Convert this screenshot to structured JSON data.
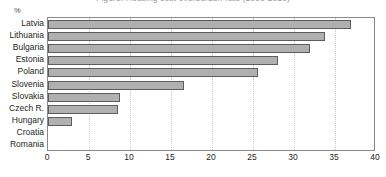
{
  "header": {
    "cropped_title": "Figure: Housing cost overburden rate (2008-2010)",
    "unit_label": "%"
  },
  "chart_data": {
    "type": "bar",
    "orientation": "horizontal",
    "title": "",
    "xlabel": "",
    "ylabel": "%",
    "xlim": [
      0,
      40
    ],
    "xticks": [
      0,
      5,
      10,
      15,
      20,
      25,
      30,
      35,
      40
    ],
    "grid": true,
    "legend": "none",
    "categories": [
      "Latvia",
      "Lithuania",
      "Bulgaria",
      "Estonia",
      "Poland",
      "Slovenia",
      "Slovakia",
      "Czech R.",
      "Hungary",
      "Croatia",
      "Romania"
    ],
    "values": [
      37.0,
      33.8,
      32.0,
      28.0,
      25.6,
      16.6,
      8.8,
      8.5,
      2.9,
      0,
      0
    ],
    "bar_fill_color": "#b0b0b0",
    "bar_border_color": "#5d5d5d",
    "grid_color": "#c9c9c9",
    "frame_color": "#8a8a8a"
  }
}
